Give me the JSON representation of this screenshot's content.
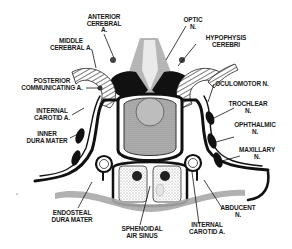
{
  "figure": {
    "labels": {
      "anterior_cerebral": {
        "line1": "ANTERIOR",
        "line2": "CEREBRAL",
        "line3": "A."
      },
      "middle_cerebral": {
        "line1": "MIDDLE",
        "line2": "CEREBRAL A."
      },
      "posterior_communicating": {
        "line1": "POSTERIOR",
        "line2": "COMMUNICATING A."
      },
      "internal_carotid_left": {
        "line1": "INTERNAL",
        "line2": "CAROTID A."
      },
      "inner_dura": {
        "line1": "INNER",
        "line2": "DURA MATER"
      },
      "endosteal_dura": {
        "line1": "ENDOSTEAL",
        "line2": "DURA MATER"
      },
      "sphenoidal_sinus": {
        "line1": "SPHENOIDAL",
        "line2": "AIR SINUS"
      },
      "internal_carotid_right": {
        "line1": "INTERNAL",
        "line2": "CAROTID A."
      },
      "abducent": {
        "line1": "ABDUCENT",
        "line2": "N."
      },
      "optic": {
        "line1": "OPTIC",
        "line2": "N."
      },
      "hypophysis": {
        "line1": "HYPOPHYSIS",
        "line2": "CEREBRI"
      },
      "oculomotor": {
        "line1": "OCULOMOTOR N."
      },
      "trochlear": {
        "line1": "TROCHLEAR",
        "line2": "N."
      },
      "ophthalmic": {
        "line1": "OPHTHALMIC",
        "line2": "N."
      },
      "maxillary": {
        "line1": "MAXILLARY",
        "line2": "N."
      }
    },
    "colors": {
      "ink": "#111111",
      "stipple": "#9a9a9a",
      "background": "#ffffff"
    }
  }
}
